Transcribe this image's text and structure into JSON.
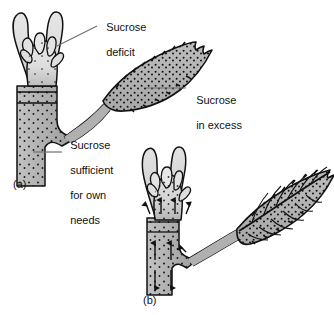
{
  "figure": {
    "background_color": "#ffffff",
    "ink_color": "#111111",
    "tissue_fill_light": "#d9d9d9",
    "tissue_fill_mid": "#b3b3b3",
    "tissue_fill_dark": "#a6a6a6",
    "stipple_color": "#1a1a1a",
    "leader_line_color": "#6e6e6e"
  },
  "annotations": [
    {
      "id": "sucrose-deficit",
      "lines": [
        "Sucrose",
        "deficit"
      ],
      "text": "Sucrose deficit",
      "points_to": "bud-apex-panel-a"
    },
    {
      "id": "sucrose-in-excess",
      "lines": [
        "Sucrose",
        "in excess"
      ],
      "text": "Sucrose in excess",
      "points_to": "leaf-blade-panel-a"
    },
    {
      "id": "sucrose-sufficient",
      "lines": [
        "Sucrose",
        "sufficient",
        "for own",
        "needs"
      ],
      "text": "Sucrose sufficient for own needs",
      "points_to": "stem-panel-a"
    }
  ],
  "panels": [
    {
      "id": "panel-a",
      "label": "(a)",
      "description": "Shoot with an expanded source leaf exporting sucrose; bud is sucrose deficient, stem is sufficient for its own needs.",
      "organs": [
        "terminal-bud",
        "stem",
        "node",
        "petiole",
        "leaf-blade"
      ],
      "stipple_density": {
        "bud": "sparse",
        "stem": "medium",
        "leaf": "dense"
      },
      "flow_arrows": []
    },
    {
      "id": "panel-b",
      "label": "(b)",
      "description": "Expanding bud becomes a sink; sucrose moves upward into the bud and downward in the stem from the mature leaf.",
      "organs": [
        "terminal-bud",
        "stem",
        "node",
        "petiole",
        "leaf-blade-veined"
      ],
      "stipple_density": {
        "bud": "medium",
        "stem": "medium",
        "leaf": "dense"
      },
      "flow_arrows": [
        {
          "id": "bud-inflow-left",
          "direction": "up",
          "target": "bud"
        },
        {
          "id": "bud-inflow-right",
          "direction": "up",
          "target": "bud"
        },
        {
          "id": "bud-inflow-outer-left",
          "direction": "up",
          "target": "bud"
        },
        {
          "id": "bud-inflow-outer-right",
          "direction": "up",
          "target": "bud"
        },
        {
          "id": "stem-upward-left",
          "direction": "up",
          "target": "stem"
        },
        {
          "id": "stem-upward-right",
          "direction": "up",
          "target": "stem"
        },
        {
          "id": "stem-downward-left",
          "direction": "down",
          "target": "stem"
        },
        {
          "id": "stem-downward-right",
          "direction": "down",
          "target": "stem"
        },
        {
          "id": "petiole-export",
          "direction": "up-left",
          "target": "node"
        }
      ]
    }
  ]
}
